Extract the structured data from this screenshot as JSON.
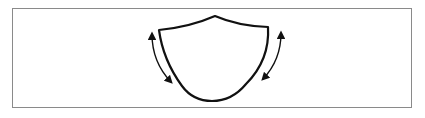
{
  "diagram": {
    "colors": {
      "stroke": "#111111",
      "frame": "#8a8a8a",
      "background": "#ffffff"
    },
    "elements": [
      {
        "id": "shield-outline",
        "type": "shape"
      },
      {
        "id": "left-curved-double-arrow",
        "type": "arrow"
      },
      {
        "id": "right-curved-double-arrow",
        "type": "arrow"
      }
    ]
  }
}
